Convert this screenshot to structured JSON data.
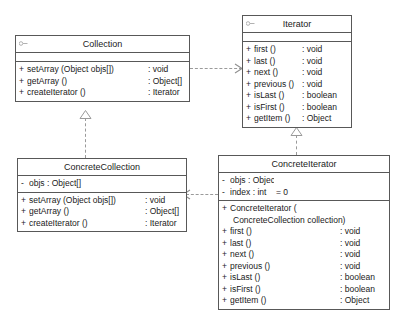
{
  "diagram": {
    "background_color": "#ffffff",
    "line_color": "#585858",
    "connector_color": "#9a9a9a"
  },
  "classes": {
    "collection": {
      "name": "Collection",
      "stereotype_icon": "interface-icon",
      "attributes": [],
      "operations": [
        {
          "visibility": "+",
          "signature": "setArray (Object objs[])",
          "separator": ":",
          "type": "void"
        },
        {
          "visibility": "+",
          "signature": "getArray ()",
          "separator": ":",
          "type": "Object[]"
        },
        {
          "visibility": "+",
          "signature": "createIterator ()",
          "separator": ":",
          "type": "Iterator"
        }
      ]
    },
    "iterator": {
      "name": "Iterator",
      "stereotype_icon": "interface-icon",
      "attributes": [],
      "operations": [
        {
          "visibility": "+",
          "signature": "first ()",
          "separator": ":",
          "type": "void"
        },
        {
          "visibility": "+",
          "signature": "last ()",
          "separator": ":",
          "type": "void"
        },
        {
          "visibility": "+",
          "signature": "next ()",
          "separator": ":",
          "type": "void"
        },
        {
          "visibility": "+",
          "signature": "previous ()",
          "separator": ":",
          "type": "void"
        },
        {
          "visibility": "+",
          "signature": "isLast ()",
          "separator": ":",
          "type": "boolean"
        },
        {
          "visibility": "+",
          "signature": "isFirst ()",
          "separator": ":",
          "type": "boolean"
        },
        {
          "visibility": "+",
          "signature": "getItem ()",
          "separator": ":",
          "type": "Object"
        }
      ]
    },
    "concrete_collection": {
      "name": "ConcreteCollection",
      "attributes": [
        {
          "visibility": "-",
          "signature": "objs",
          "separator": ":",
          "type": "Object[]"
        }
      ],
      "operations": [
        {
          "visibility": "+",
          "signature": "setArray (Object objs[])",
          "separator": ":",
          "type": "void"
        },
        {
          "visibility": "+",
          "signature": "getArray ()",
          "separator": ":",
          "type": "Object[]"
        },
        {
          "visibility": "+",
          "signature": "createIterator ()",
          "separator": ":",
          "type": "Iterator"
        }
      ]
    },
    "concrete_iterator": {
      "name": "ConcreteIterator",
      "attributes": [
        {
          "visibility": "-",
          "signature": "objs",
          "separator": ":",
          "type": "Object[]",
          "default": ""
        },
        {
          "visibility": "-",
          "signature": "index",
          "separator": ":",
          "type": "int",
          "default": "= 0"
        }
      ],
      "constructor": {
        "visibility": "+",
        "line1": "ConcreteIterator (",
        "line2": "ConcreteCollection collection)"
      },
      "operations": [
        {
          "visibility": "+",
          "signature": "first ()",
          "separator": ":",
          "type": "void"
        },
        {
          "visibility": "+",
          "signature": "last ()",
          "separator": ":",
          "type": "void"
        },
        {
          "visibility": "+",
          "signature": "next ()",
          "separator": ":",
          "type": "void"
        },
        {
          "visibility": "+",
          "signature": "previous ()",
          "separator": ":",
          "type": "void"
        },
        {
          "visibility": "+",
          "signature": "isLast ()",
          "separator": ":",
          "type": "boolean"
        },
        {
          "visibility": "+",
          "signature": "isFirst ()",
          "separator": ":",
          "type": "boolean"
        },
        {
          "visibility": "+",
          "signature": "getItem ()",
          "separator": ":",
          "type": "Object"
        }
      ]
    }
  },
  "relationships": [
    {
      "id": "rel-collection-realization",
      "kind": "realization",
      "from": "ConcreteCollection",
      "to": "Collection",
      "style": "dashed",
      "head": "hollow-triangle"
    },
    {
      "id": "rel-iterator-realization",
      "kind": "realization",
      "from": "ConcreteIterator",
      "to": "Iterator",
      "style": "dashed",
      "head": "hollow-triangle"
    },
    {
      "id": "rel-collection-iterator-dependency",
      "kind": "dependency",
      "from": "Collection",
      "to": "Iterator",
      "style": "dashed",
      "head": "open-arrow"
    },
    {
      "id": "rel-concreteiterator-concretecollection-dependency",
      "kind": "dependency",
      "from": "ConcreteIterator",
      "to": "ConcreteCollection",
      "style": "dashed",
      "head": "open-arrow"
    }
  ]
}
